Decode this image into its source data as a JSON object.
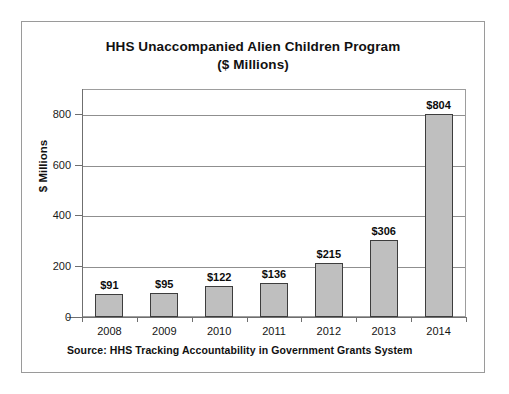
{
  "chart_data": {
    "type": "bar",
    "title": "HHS Unaccompanied Alien Children Program",
    "subtitle": "($ Millions)",
    "xlabel": "",
    "ylabel": "$ Millions",
    "categories": [
      "2008",
      "2009",
      "2010",
      "2011",
      "2012",
      "2013",
      "2014"
    ],
    "values": [
      91,
      95,
      122,
      136,
      215,
      306,
      804
    ],
    "data_labels": [
      "$91",
      "$95",
      "$122",
      "$136",
      "$215",
      "$306",
      "$804"
    ],
    "ylim": [
      0,
      860
    ],
    "yticks": [
      0,
      200,
      400,
      600,
      800
    ],
    "ytick_labels": [
      "0",
      "200",
      "400",
      "600",
      "800"
    ],
    "grid": true,
    "legend": null,
    "bar_color": "#bfbfbf",
    "bar_border_color": "#3d3d3d",
    "source_note": "Source: HHS Tracking Accountability in Government Grants System"
  }
}
